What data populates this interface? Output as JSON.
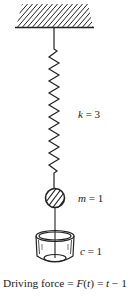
{
  "diagram": {
    "ceiling": {
      "name": "fixed support",
      "hatched": true
    },
    "spring": {
      "symbol": "k",
      "value": "3",
      "label_eq": " = 3"
    },
    "mass": {
      "symbol": "m",
      "value": "1",
      "label_eq": " = 1"
    },
    "damper": {
      "symbol": "c",
      "value": "1",
      "label_eq": " = 1"
    },
    "caption": {
      "prefix": "Driving force = ",
      "func": "F",
      "paren_open": "(",
      "var": "t",
      "paren_close": ")",
      "eq": " = ",
      "rhs_var": "t",
      "rhs_rest": " − 1"
    },
    "colors": {
      "stroke": "#222222",
      "background": "#ffffff"
    }
  }
}
